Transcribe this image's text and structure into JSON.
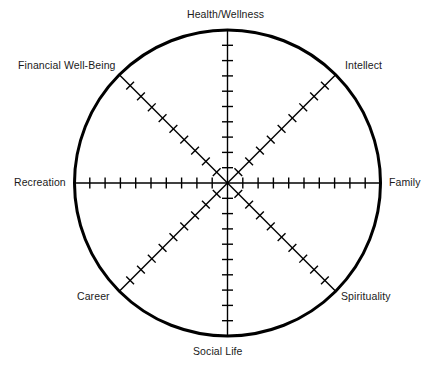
{
  "diagram": {
    "type": "radar-wheel",
    "center": {
      "x": 227.5,
      "y": 183
    },
    "radius": 153,
    "background_color": "#ffffff",
    "line_color": "#000000",
    "text_color": "#1a1a1a",
    "circle_stroke_width": 3,
    "spoke_stroke_width": 1.4,
    "tick_stroke_width": 1.4,
    "ticks_per_spoke": 10,
    "axes": [
      {
        "id": "health-wellness",
        "label": "Health/Wellness",
        "angle_deg": 90,
        "anchor": "center"
      },
      {
        "id": "intellect",
        "label": "Intellect",
        "angle_deg": 45,
        "anchor": "start"
      },
      {
        "id": "family",
        "label": "Family",
        "angle_deg": 0,
        "anchor": "start"
      },
      {
        "id": "spirituality",
        "label": "Spirituality",
        "angle_deg": -45,
        "anchor": "start"
      },
      {
        "id": "social-life",
        "label": "Social Life",
        "angle_deg": -90,
        "anchor": "center"
      },
      {
        "id": "career",
        "label": "Career",
        "angle_deg": -135,
        "anchor": "end"
      },
      {
        "id": "recreation",
        "label": "Recreation",
        "angle_deg": 180,
        "anchor": "end"
      },
      {
        "id": "financial-well-being",
        "label": "Financial Well-Being",
        "angle_deg": 135,
        "anchor": "end"
      }
    ]
  },
  "chart_data": {
    "type": "radar",
    "categories": [
      "Health/Wellness",
      "Intellect",
      "Family",
      "Spirituality",
      "Social Life",
      "Career",
      "Recreation",
      "Financial Well-Being"
    ],
    "series": [],
    "scale_min": 0,
    "scale_max": 10,
    "tick_count": 10,
    "grid": false,
    "legend": "none"
  }
}
